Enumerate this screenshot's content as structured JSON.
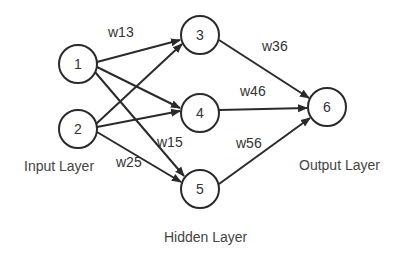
{
  "diagram": {
    "nodes": [
      {
        "id": "1",
        "label": "1",
        "layer": "input"
      },
      {
        "id": "2",
        "label": "2",
        "layer": "input"
      },
      {
        "id": "3",
        "label": "3",
        "layer": "hidden"
      },
      {
        "id": "4",
        "label": "4",
        "layer": "hidden"
      },
      {
        "id": "5",
        "label": "5",
        "layer": "hidden"
      },
      {
        "id": "6",
        "label": "6",
        "layer": "output"
      }
    ],
    "edges": [
      {
        "from": "1",
        "to": "3",
        "label": "w13"
      },
      {
        "from": "1",
        "to": "4",
        "label": ""
      },
      {
        "from": "1",
        "to": "5",
        "label": "w15"
      },
      {
        "from": "2",
        "to": "3",
        "label": ""
      },
      {
        "from": "2",
        "to": "4",
        "label": ""
      },
      {
        "from": "2",
        "to": "5",
        "label": "w25"
      },
      {
        "from": "3",
        "to": "6",
        "label": "w36"
      },
      {
        "from": "4",
        "to": "6",
        "label": "w46"
      },
      {
        "from": "5",
        "to": "6",
        "label": "w56"
      }
    ],
    "layers": {
      "input": "Input Layer",
      "hidden": "Hidden Layer",
      "output": "Output Layer"
    },
    "colors": {
      "stroke": "#2a2a2a",
      "text": "#333333",
      "background": "#ffffff"
    }
  }
}
